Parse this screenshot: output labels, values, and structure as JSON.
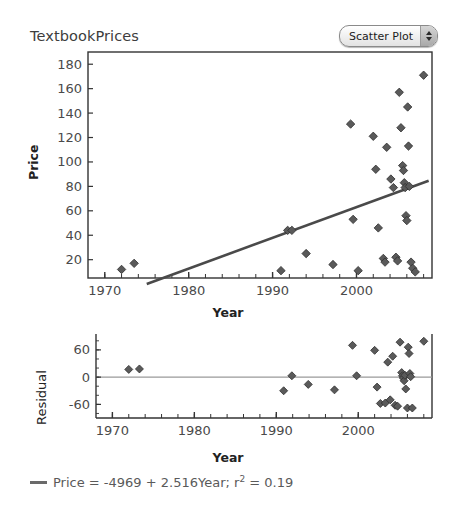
{
  "header": {
    "title": "TextbookPrices",
    "dropdown": {
      "selected": "Scatter Plot",
      "stepper_up_icon": "triangle-up-icon",
      "stepper_down_icon": "triangle-down-icon"
    }
  },
  "footer": {
    "equation_prefix": "Price = -4969 + 2.516Year;  r",
    "equation_exp": "2",
    "equation_suffix": " = 0.19",
    "equation_full": "Price = -4969 + 2.516Year; r2 = 0.19",
    "line_swatch_color": "#6a6a6a"
  },
  "chart_data": [
    {
      "type": "scatter",
      "name": "price-vs-year-scatter",
      "title": "TextbookPrices",
      "xlabel": "Year",
      "ylabel": "Price",
      "xlim": [
        1968,
        2009
      ],
      "ylim": [
        5,
        190
      ],
      "xticks": [
        1970,
        1980,
        1990,
        2000
      ],
      "yticks": [
        20,
        40,
        60,
        80,
        100,
        120,
        140,
        160,
        180
      ],
      "xminor_step": 2,
      "grid": false,
      "legend": "none",
      "marker": "diamond",
      "marker_color": "#5a5a5a",
      "frame": "box",
      "points": [
        {
          "x": 1972.0,
          "y": 12
        },
        {
          "x": 1973.5,
          "y": 17
        },
        {
          "x": 1991.0,
          "y": 11
        },
        {
          "x": 1991.8,
          "y": 44
        },
        {
          "x": 1992.3,
          "y": 44
        },
        {
          "x": 1994.0,
          "y": 25
        },
        {
          "x": 1997.2,
          "y": 16
        },
        {
          "x": 1999.3,
          "y": 131
        },
        {
          "x": 1999.6,
          "y": 53
        },
        {
          "x": 2000.2,
          "y": 11
        },
        {
          "x": 2002.0,
          "y": 121
        },
        {
          "x": 2002.3,
          "y": 94
        },
        {
          "x": 2002.6,
          "y": 46
        },
        {
          "x": 2003.2,
          "y": 21
        },
        {
          "x": 2003.4,
          "y": 18
        },
        {
          "x": 2003.6,
          "y": 112
        },
        {
          "x": 2004.1,
          "y": 86
        },
        {
          "x": 2004.4,
          "y": 79
        },
        {
          "x": 2004.7,
          "y": 22
        },
        {
          "x": 2004.9,
          "y": 19
        },
        {
          "x": 2005.1,
          "y": 157
        },
        {
          "x": 2005.3,
          "y": 128
        },
        {
          "x": 2005.5,
          "y": 97
        },
        {
          "x": 2005.6,
          "y": 93
        },
        {
          "x": 2005.7,
          "y": 83
        },
        {
          "x": 2005.8,
          "y": 79
        },
        {
          "x": 2005.9,
          "y": 56
        },
        {
          "x": 2006.0,
          "y": 52
        },
        {
          "x": 2006.1,
          "y": 145
        },
        {
          "x": 2006.2,
          "y": 113
        },
        {
          "x": 2006.3,
          "y": 80
        },
        {
          "x": 2006.5,
          "y": 18
        },
        {
          "x": 2006.7,
          "y": 13
        },
        {
          "x": 2007.0,
          "y": 10
        },
        {
          "x": 2008.0,
          "y": 171
        }
      ],
      "fit_line": {
        "label": "Price = -4969 + 2.516Year",
        "intercept": -4969,
        "slope": 2.516,
        "r2": 0.19,
        "x_start": 1975.0,
        "x_end": 2008.6,
        "color": "#4a4a4a"
      }
    },
    {
      "type": "scatter",
      "name": "residual-vs-year-scatter",
      "xlabel": "Year",
      "ylabel": "Residual",
      "xlim": [
        1968,
        2009
      ],
      "ylim": [
        -90,
        95
      ],
      "xticks": [
        1970,
        1980,
        1990,
        2000
      ],
      "yticks": [
        -60,
        0,
        60
      ],
      "xminor_step": 2,
      "grid": false,
      "legend": "none",
      "marker": "diamond",
      "marker_color": "#5a5a5a",
      "frame": "left-right-bottom",
      "zero_line": true,
      "points": [
        {
          "x": 1972.0,
          "y": 17
        },
        {
          "x": 1973.3,
          "y": 18
        },
        {
          "x": 1990.9,
          "y": -30
        },
        {
          "x": 1991.9,
          "y": 3
        },
        {
          "x": 1993.9,
          "y": -16
        },
        {
          "x": 1997.1,
          "y": -28
        },
        {
          "x": 1999.3,
          "y": 70
        },
        {
          "x": 1999.8,
          "y": 3
        },
        {
          "x": 2002.0,
          "y": 59
        },
        {
          "x": 2002.3,
          "y": -22
        },
        {
          "x": 2002.7,
          "y": -58
        },
        {
          "x": 2003.3,
          "y": -57
        },
        {
          "x": 2003.6,
          "y": 33
        },
        {
          "x": 2003.9,
          "y": -50
        },
        {
          "x": 2004.2,
          "y": 46
        },
        {
          "x": 2004.5,
          "y": -62
        },
        {
          "x": 2004.8,
          "y": -64
        },
        {
          "x": 2005.1,
          "y": 77
        },
        {
          "x": 2005.3,
          "y": 10
        },
        {
          "x": 2005.4,
          "y": 3
        },
        {
          "x": 2005.5,
          "y": -2
        },
        {
          "x": 2005.6,
          "y": -8
        },
        {
          "x": 2005.7,
          "y": 4
        },
        {
          "x": 2005.8,
          "y": -26
        },
        {
          "x": 2006.0,
          "y": -68
        },
        {
          "x": 2006.1,
          "y": 66
        },
        {
          "x": 2006.2,
          "y": 52
        },
        {
          "x": 2006.3,
          "y": 8
        },
        {
          "x": 2006.4,
          "y": 1
        },
        {
          "x": 2006.6,
          "y": -68
        },
        {
          "x": 2008.0,
          "y": 79
        }
      ]
    }
  ]
}
